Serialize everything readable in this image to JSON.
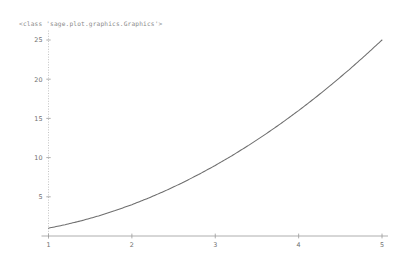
{
  "output": {
    "repr_text": "<class 'sage.plot.graphics.Graphics'>"
  },
  "colors": {
    "background": "#ffffff",
    "curve": "#6e6e6e",
    "axis": "#9a9a9a",
    "axis_dotted": "#b4b4b4",
    "tick_label": "#707070",
    "repr_text": "#8c8c8c"
  },
  "chart_data": {
    "type": "line",
    "title": "",
    "xlabel": "",
    "ylabel": "",
    "xlim": [
      1,
      5
    ],
    "ylim": [
      0,
      26
    ],
    "grid": false,
    "legend": false,
    "function": "y = x^2",
    "xticks": [
      1,
      2,
      3,
      4,
      5
    ],
    "xtick_labels": [
      "1",
      "2",
      "3",
      "4",
      "5"
    ],
    "yticks": [
      5,
      10,
      15,
      20,
      25
    ],
    "ytick_labels": [
      "5",
      "10",
      "15",
      "20",
      "25"
    ],
    "series": [
      {
        "name": "x^2",
        "color": "#6e6e6e",
        "x": [
          1.0,
          1.2,
          1.4,
          1.6,
          1.8,
          2.0,
          2.2,
          2.4,
          2.6,
          2.8,
          3.0,
          3.2,
          3.4,
          3.6,
          3.8,
          4.0,
          4.2,
          4.4,
          4.6,
          4.8,
          5.0
        ],
        "values": [
          1.0,
          1.44,
          1.96,
          2.56,
          3.24,
          4.0,
          4.84,
          5.76,
          6.76,
          7.84,
          9.0,
          10.24,
          11.56,
          12.96,
          14.44,
          16.0,
          17.64,
          19.36,
          21.16,
          23.04,
          25.0
        ]
      }
    ]
  }
}
